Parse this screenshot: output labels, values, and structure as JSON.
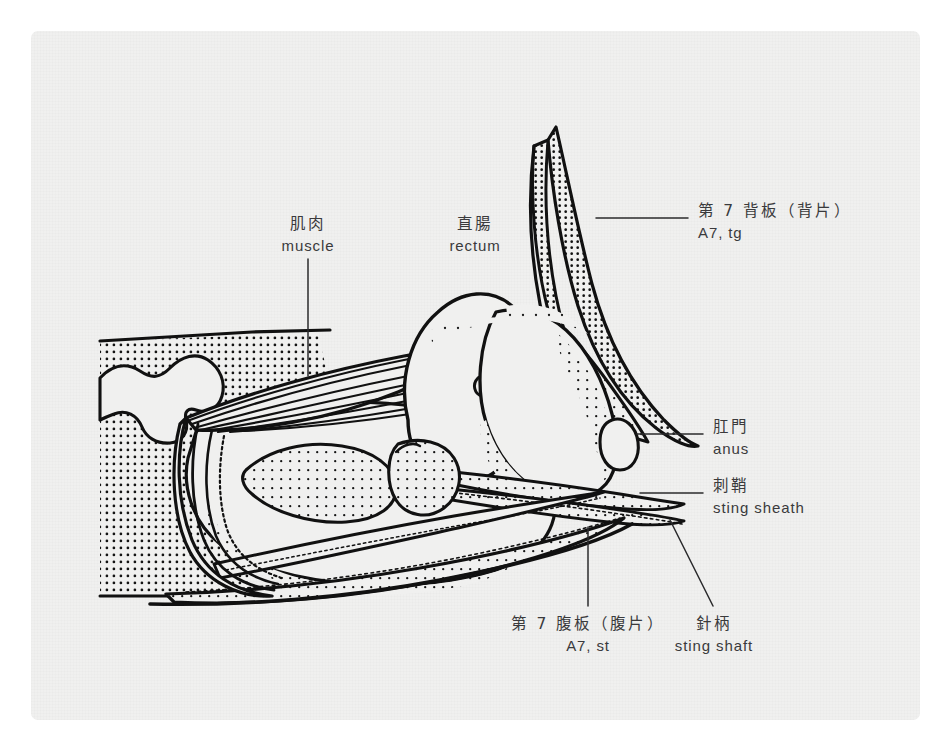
{
  "figure": {
    "kind": "anatomical-line-diagram",
    "panel_background": "#f0f0ef",
    "ink_color": "#111111",
    "text_color": "#3a3a3c"
  },
  "labels": [
    {
      "id": "muscle",
      "cjk": "肌肉",
      "romaji": "muscle",
      "has_leader": true
    },
    {
      "id": "rectum",
      "cjk": "直腸",
      "romaji": "rectum",
      "has_leader": false
    },
    {
      "id": "tergite7",
      "cjk": "第 7 背板（背片）",
      "romaji": "A7, tg",
      "has_leader": true
    },
    {
      "id": "anus",
      "cjk": "肛門",
      "romaji": "anus",
      "has_leader": true
    },
    {
      "id": "sting-sheath",
      "cjk": "刺鞘",
      "romaji": "sting sheath",
      "has_leader": true
    },
    {
      "id": "sternite7",
      "cjk": "第 7 腹板（腹片）",
      "romaji": "A7, st",
      "has_leader": true
    },
    {
      "id": "sting-shaft",
      "cjk": "針柄",
      "romaji": "sting shaft",
      "has_leader": true
    }
  ]
}
